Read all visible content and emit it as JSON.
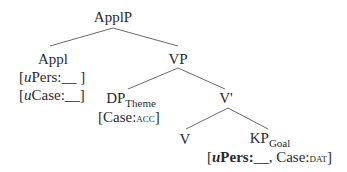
{
  "tree": {
    "root": {
      "label": "ApplP"
    },
    "appl": {
      "label": "Appl",
      "features": [
        {
          "prefix": "[",
          "u": "u",
          "text": "Pers:__ ]"
        },
        {
          "prefix": "[",
          "u": "u",
          "text": "Case:__]"
        }
      ]
    },
    "vp": {
      "label": "VP"
    },
    "dp": {
      "label": "DP",
      "subscript": "Theme",
      "features": {
        "open": "[Case:",
        "value": "ACC",
        "close": "]"
      }
    },
    "vbar": {
      "label": "V'"
    },
    "v": {
      "label": "V"
    },
    "kp": {
      "label": "KP",
      "subscript": "Goal",
      "features": {
        "open": "[",
        "u": "u",
        "pers": "Pers:",
        "blank": "__,",
        "case": " Case:",
        "value": "DAT",
        "close": "]"
      }
    }
  },
  "colors": {
    "edge": "#6a6a6a",
    "text": "#2a2a2a"
  }
}
